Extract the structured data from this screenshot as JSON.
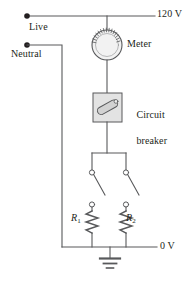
{
  "figure": {
    "kind": "circuit-diagram",
    "width": 194,
    "height": 282,
    "background": "#ffffff",
    "ink": "#58595b",
    "text_color": "#231f20",
    "component_fill": "#e6e6e6"
  },
  "labels": {
    "live": "Live",
    "neutral": "Neutral",
    "supply_voltage": "120 V",
    "meter": "Meter",
    "circuit_breaker_line1": "Circuit",
    "circuit_breaker_line2": "breaker",
    "ground_voltage": "0 V",
    "resistor1": "R",
    "resistor1_sub": "1",
    "resistor2": "R",
    "resistor2_sub": "2"
  },
  "nodes": {
    "live_terminal": {
      "x": 27,
      "y": 16
    },
    "neutral_terminal": {
      "x": 27,
      "y": 45
    }
  },
  "components": [
    {
      "name": "meter",
      "type": "circle-gauge",
      "cx": 107,
      "cy": 45,
      "r": 15
    },
    {
      "name": "circuit-breaker",
      "type": "box-switch",
      "x": 93,
      "y": 93,
      "w": 29,
      "h": 29
    },
    {
      "name": "switch-left",
      "type": "knife-switch",
      "x": 92,
      "y_top": 173,
      "y_bottom": 202
    },
    {
      "name": "switch-right",
      "type": "knife-switch",
      "x": 126,
      "y_top": 173,
      "y_bottom": 202
    },
    {
      "name": "resistor-1",
      "type": "zigzag-resistor",
      "x": 92,
      "y_top": 208,
      "y_bottom": 234
    },
    {
      "name": "resistor-2",
      "type": "zigzag-resistor",
      "x": 126,
      "y_top": 208,
      "y_bottom": 234
    },
    {
      "name": "ground",
      "type": "earth-symbol",
      "x": 110,
      "y": 248
    }
  ],
  "rails": {
    "top_rail_y": 16,
    "bottom_rail_y": 247,
    "neutral_rail_x": 62,
    "live_rail_x": 107
  }
}
